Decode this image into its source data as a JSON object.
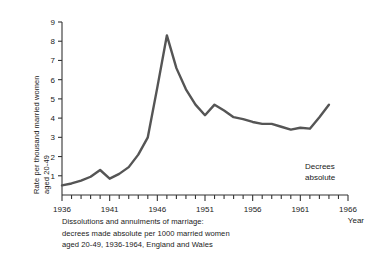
{
  "chart_data": {
    "type": "line",
    "title": "",
    "caption_lines": [
      "Dissolutions and annulments of marriage:",
      "decrees made absolute per 1000 married women",
      "aged 20-49, 1936-1964, England and Wales"
    ],
    "xlabel": "Year",
    "ylabel_lines": [
      "Rate per thousand married women",
      "aged 20-49"
    ],
    "xlim": [
      1936,
      1966
    ],
    "ylim": [
      0,
      9
    ],
    "x_tick_labels": [
      "1936",
      "1941",
      "1946",
      "1951",
      "1956",
      "1961",
      "1966"
    ],
    "x_tick_values": [
      1936,
      1941,
      1946,
      1951,
      1956,
      1961,
      1966
    ],
    "x_minor_tick_step": 1,
    "y_tick_labels": [
      "1",
      "2",
      "3",
      "4",
      "5",
      "6",
      "7",
      "8",
      "9"
    ],
    "y_tick_values": [
      1,
      2,
      3,
      4,
      5,
      6,
      7,
      8,
      9
    ],
    "grid": false,
    "legend_position": "inside-right",
    "line_color": "#555555",
    "axis_color": "#333333",
    "background": "#ffffff",
    "series": [
      {
        "name": "Decrees absolute",
        "legend_label_lines": [
          "Decrees",
          "absolute"
        ],
        "x": [
          1936,
          1937,
          1938,
          1939,
          1940,
          1941,
          1942,
          1943,
          1944,
          1945,
          1946,
          1947,
          1948,
          1949,
          1950,
          1951,
          1952,
          1953,
          1954,
          1955,
          1956,
          1957,
          1958,
          1959,
          1960,
          1961,
          1962,
          1963,
          1964
        ],
        "values": [
          0.5,
          0.6,
          0.75,
          0.95,
          1.3,
          0.85,
          1.1,
          1.45,
          2.1,
          3.0,
          5.6,
          8.3,
          6.6,
          5.5,
          4.7,
          4.15,
          4.7,
          4.4,
          4.05,
          3.95,
          3.8,
          3.7,
          3.7,
          3.55,
          3.4,
          3.5,
          3.45,
          4.05,
          4.7
        ]
      }
    ]
  }
}
